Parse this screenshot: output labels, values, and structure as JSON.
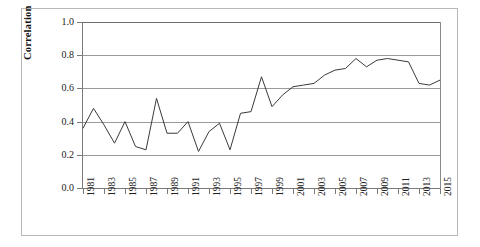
{
  "figure": {
    "ylabel": "Correlation"
  },
  "chart_data": {
    "type": "line",
    "title": "",
    "xlabel": "",
    "ylabel": "Correlation",
    "ylim": [
      0.0,
      1.0
    ],
    "xlim": [
      1981,
      2015
    ],
    "grid": true,
    "legend": false,
    "y_ticks": [
      "0.0",
      "0.2",
      "0.4",
      "0.6",
      "0.8",
      "1.0"
    ],
    "y_tick_values": [
      0.0,
      0.2,
      0.4,
      0.6,
      0.8,
      1.0
    ],
    "x_tick_labels": [
      "1981",
      "1983",
      "1985",
      "1987",
      "1989",
      "1991",
      "1993",
      "1995",
      "1997",
      "1999",
      "2001",
      "2003",
      "2005",
      "2007",
      "2009",
      "2011",
      "2013",
      "2015"
    ],
    "x": [
      1981,
      1982,
      1983,
      1984,
      1985,
      1986,
      1987,
      1988,
      1989,
      1990,
      1991,
      1992,
      1993,
      1994,
      1995,
      1996,
      1997,
      1998,
      1999,
      2000,
      2001,
      2002,
      2003,
      2004,
      2005,
      2006,
      2007,
      2008,
      2009,
      2010,
      2011,
      2012,
      2013,
      2014,
      2015
    ],
    "values": [
      0.36,
      0.48,
      0.38,
      0.27,
      0.4,
      0.25,
      0.23,
      0.54,
      0.33,
      0.33,
      0.4,
      0.22,
      0.34,
      0.39,
      0.23,
      0.45,
      0.46,
      0.67,
      0.49,
      0.56,
      0.61,
      0.62,
      0.63,
      0.68,
      0.71,
      0.72,
      0.78,
      0.73,
      0.77,
      0.78,
      0.77,
      0.76,
      0.63,
      0.62,
      0.65
    ],
    "series": [
      {
        "name": "Correlation",
        "color": "#3a3a3a",
        "values": [
          0.36,
          0.48,
          0.38,
          0.27,
          0.4,
          0.25,
          0.23,
          0.54,
          0.33,
          0.33,
          0.4,
          0.22,
          0.34,
          0.39,
          0.23,
          0.45,
          0.46,
          0.67,
          0.49,
          0.56,
          0.61,
          0.62,
          0.63,
          0.68,
          0.71,
          0.72,
          0.78,
          0.73,
          0.77,
          0.78,
          0.77,
          0.76,
          0.63,
          0.62,
          0.65
        ]
      }
    ]
  }
}
